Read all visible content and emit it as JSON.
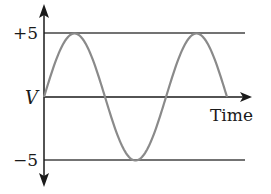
{
  "diagram": {
    "type": "sine-wave-voltage-time",
    "y_axis_label": "V",
    "x_axis_label": "Time",
    "ticks": [
      {
        "label": "+5",
        "value": 5
      },
      {
        "label": "−5",
        "value": -5
      }
    ],
    "wave": {
      "amplitude": 5,
      "cycles": 1.5,
      "start_phase": "zero, rising"
    },
    "colors": {
      "axis": "#1a1a1a",
      "reference_lines": "#444444",
      "wave": "#8a8a8a"
    }
  },
  "chart_data": {
    "type": "line",
    "title": "",
    "xlabel": "Time",
    "ylabel": "V",
    "yticks": [
      "+5",
      "−5"
    ],
    "ylim": [
      -5,
      5
    ],
    "grid": false,
    "series": [
      {
        "name": "V(t) sine wave",
        "x": [
          0,
          0.25,
          0.5,
          0.75,
          1.0,
          1.25,
          1.5
        ],
        "values": [
          0,
          5,
          0,
          -5,
          0,
          5,
          0
        ]
      }
    ],
    "reference_lines": [
      5,
      0,
      -5
    ]
  }
}
